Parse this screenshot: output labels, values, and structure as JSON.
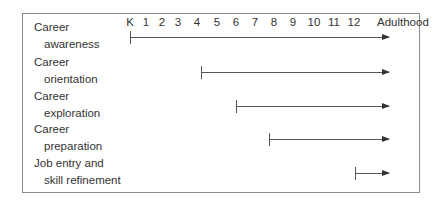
{
  "diagram": {
    "type": "timeline",
    "axis": {
      "ticks": [
        "K",
        "1",
        "2",
        "3",
        "4",
        "5",
        "6",
        "7",
        "8",
        "9",
        "10",
        "11",
        "12",
        "Adulthood"
      ],
      "tick_x": [
        130,
        146,
        162,
        178,
        197,
        217,
        236,
        255,
        274,
        293,
        314,
        334,
        354,
        377
      ]
    },
    "stages": [
      {
        "line1": "Career",
        "line2": "awareness",
        "start": "K",
        "end": "Adulthood",
        "start_x": 130,
        "y": 37
      },
      {
        "line1": "Career",
        "line2": "orientation",
        "start": "4",
        "end": "Adulthood",
        "start_x": 201,
        "y": 72
      },
      {
        "line1": "Career",
        "line2": "exploration",
        "start": "6",
        "end": "Adulthood",
        "start_x": 236,
        "y": 106
      },
      {
        "line1": "Career",
        "line2": "preparation",
        "start": "8",
        "end": "Adulthood",
        "start_x": 269,
        "y": 139
      },
      {
        "line1": "Job entry and",
        "line2": "skill refinement",
        "start": "12",
        "end": "Adulthood",
        "start_x": 355,
        "y": 173
      }
    ],
    "arrow_end_x": 389,
    "colors": {
      "line": "#555555",
      "border": "#8a8a8a",
      "text": "#333333"
    }
  }
}
